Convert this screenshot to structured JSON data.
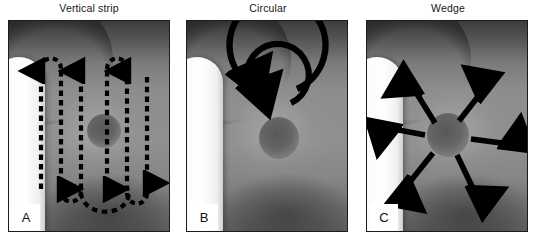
{
  "figure": {
    "caption_style": "three-panel medical illustration of breast self-examination search patterns",
    "panel_count": 3,
    "background_color": "#ffffff",
    "border_color": "#1c1c1c",
    "arrow_color": "#000000",
    "skin_color": "#8b8b8b",
    "highlight_color": "#ffffff"
  },
  "panels": [
    {
      "letter": "A",
      "title": "Vertical strip",
      "pattern": "vertical-strip",
      "arrow_style": "dashed",
      "description": "serpentine up-and-down dashed arrows sweeping across the breast in vertical strips"
    },
    {
      "letter": "B",
      "title": "Circular",
      "pattern": "circular",
      "arrow_style": "solid-arc",
      "description": "two concentric solid arcs with arrowheads spiraling around the nipple"
    },
    {
      "letter": "C",
      "title": "Wedge",
      "pattern": "wedge",
      "arrow_style": "solid-straight",
      "description": "six solid straight arrows radiating outward from the nipple"
    }
  ]
}
